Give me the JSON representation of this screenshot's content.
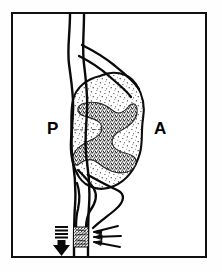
{
  "figure": {
    "frame": {
      "border_color": "#111111",
      "background_color": "#ffffff",
      "border_width_px": 2
    },
    "orientation_labels": {
      "posterior": "P",
      "anterior": "A"
    },
    "colors": {
      "ink": "#000000",
      "outline": "#111111",
      "paper": "#ffffff",
      "stipple": "#1a1a1a"
    },
    "structures": [
      {
        "name": "aorta",
        "kind": "vessel",
        "description": "vertical vessel running top to bottom"
      },
      {
        "name": "renal-artery-upper-branch",
        "kind": "vessel",
        "description": "superior branch curving to upper pole"
      },
      {
        "name": "renal-artery-lower-branch",
        "kind": "vessel",
        "description": "inferior branch returning from lower pole"
      },
      {
        "name": "kidney",
        "kind": "organ",
        "description": "stippled reniform organ with dark central hilum"
      },
      {
        "name": "kidney-hilum",
        "kind": "organ-region",
        "description": "dense dark collecting system / sinus"
      },
      {
        "name": "stenotic-segment",
        "kind": "lesion",
        "description": "stippled plaque narrowing the vessel lumen"
      }
    ],
    "annotations": {
      "flow_arrow": {
        "name": "flow-direction-arrow",
        "direction": "down",
        "style": "striped-shaft-solid-head"
      },
      "pointer_arrows": {
        "name": "stenosis-pointer-arrows",
        "count": 3,
        "direction": "left",
        "points_at": "stenotic-segment"
      }
    }
  }
}
